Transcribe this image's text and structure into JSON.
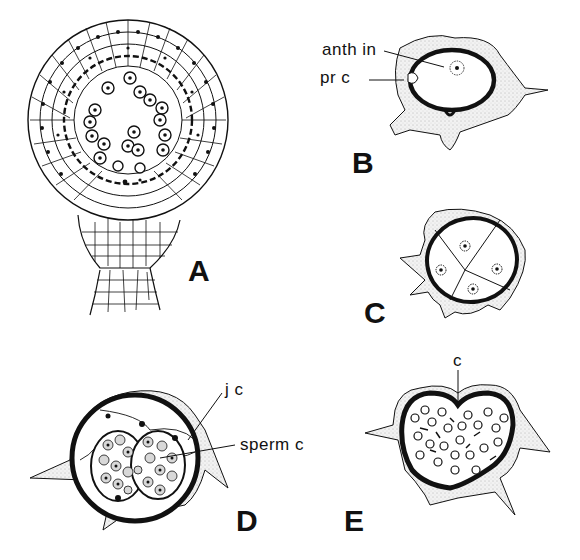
{
  "figure": {
    "panels": [
      {
        "id": "A",
        "label": "A",
        "description": "Longitudinal section of stalked antheridium with jacket cell layers and central mass of sperm cells"
      },
      {
        "id": "B",
        "label": "B",
        "description": "Young antheridium with antheridial initial and primary cell"
      },
      {
        "id": "C",
        "label": "C",
        "description": "Antheridium divided into four cells"
      },
      {
        "id": "D",
        "label": "D",
        "description": "Antheridium with jacket cell and two masses of spermatogenous cells"
      },
      {
        "id": "E",
        "label": "E",
        "description": "Mature antheridium with cap opening and released sperm"
      }
    ],
    "annotations": {
      "anth_in": "anth in",
      "pr_c": "pr c",
      "j_c": "j c",
      "sperm_c": "sperm c",
      "c": "c"
    },
    "colors": {
      "ink": "#111111",
      "stipple": "#e8e8e8",
      "background": "#ffffff"
    }
  }
}
